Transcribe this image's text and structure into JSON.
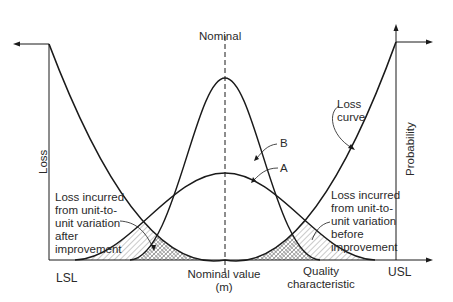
{
  "diagram": {
    "title_top": "Nominal",
    "y_axis_left": "Loss",
    "y_axis_right": "Probability",
    "x_axis": {
      "lsl": "LSL",
      "usl": "USL",
      "nominal_line1": "Nominal value",
      "nominal_line2": "(m)",
      "quality_line1": "Quality",
      "quality_line2": "characteristic"
    },
    "curves": {
      "b_label": "B",
      "a_label": "A",
      "loss_line1": "Loss",
      "loss_line2": "curve"
    },
    "annotations": {
      "after": [
        "Loss incurred",
        "from unit-to-",
        "unit variation",
        "after",
        "improvement"
      ],
      "before": [
        "Loss incurred",
        "from unit-to-",
        "unit variation",
        "before",
        "improvement"
      ]
    },
    "colors": {
      "line": "#1a1a1a",
      "text": "#2a2a2a",
      "hatch": "#555555"
    }
  }
}
